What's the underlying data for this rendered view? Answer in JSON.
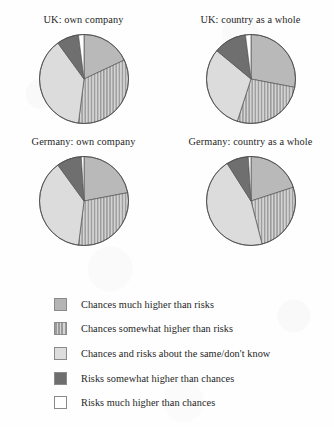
{
  "figure": {
    "background_color": "#fefefe",
    "text_color": "#1f1f1f"
  },
  "legend": {
    "position": "below-charts",
    "items": [
      {
        "label": "Chances much higher than risks",
        "swatch": "solid-mid",
        "color": "#b4b4b4"
      },
      {
        "label": "Chances somewhat higher than risks",
        "swatch": "stripe-mid",
        "color": "#9a9a9a"
      },
      {
        "label": "Chances and risks about the same/don't know",
        "swatch": "solid-light",
        "color": "#dddddd"
      },
      {
        "label": "Risks somewhat higher than chances",
        "swatch": "solid-dark",
        "color": "#6e6e6e"
      },
      {
        "label": "Risks much higher than chances",
        "swatch": "white",
        "color": "#ffffff"
      }
    ]
  },
  "chart_data": [
    {
      "type": "pie",
      "title": "UK: own company",
      "categories": [
        "Chances much higher than risks",
        "Chances somewhat higher than risks",
        "Chances and risks about the same/don't know",
        "Risks somewhat higher than chances",
        "Risks much higher than chances"
      ],
      "values": [
        18,
        34,
        38,
        8,
        2
      ],
      "unit": "percent",
      "start_angle_deg": 0,
      "direction": "clockwise"
    },
    {
      "type": "pie",
      "title": "UK: country as a whole",
      "categories": [
        "Chances much higher than risks",
        "Chances somewhat higher than risks",
        "Chances and risks about the same/don't know",
        "Risks somewhat higher than chances",
        "Risks much higher than chances"
      ],
      "values": [
        28,
        27,
        31,
        12,
        2
      ],
      "unit": "percent",
      "start_angle_deg": 0,
      "direction": "clockwise"
    },
    {
      "type": "pie",
      "title": "Germany: own company",
      "categories": [
        "Chances much higher than risks",
        "Chances somewhat higher than risks",
        "Chances and risks about the same/don't know",
        "Risks somewhat higher than chances",
        "Risks much higher than chances"
      ],
      "values": [
        22,
        30,
        38,
        9,
        1
      ],
      "unit": "percent",
      "start_angle_deg": 0,
      "direction": "clockwise"
    },
    {
      "type": "pie",
      "title": "Germany: country as a whole",
      "categories": [
        "Chances much higher than risks",
        "Chances somewhat higher than risks",
        "Chances and risks about the same/don't know",
        "Risks somewhat higher than chances",
        "Risks much higher than chances"
      ],
      "values": [
        20,
        26,
        45,
        8,
        1
      ],
      "unit": "percent",
      "start_angle_deg": 0,
      "direction": "clockwise"
    }
  ]
}
